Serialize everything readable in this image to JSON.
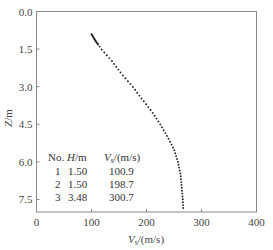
{
  "chart_data": {
    "type": "scatter",
    "title": "",
    "xlabel": "V_s/(m/s)",
    "xlabel_main": "V",
    "xlabel_sub": "s",
    "xlabel_unit": "/(m/s)",
    "ylabel": "Z/m",
    "xlim": [
      0,
      400
    ],
    "ylim": [
      8.0,
      0.0
    ],
    "y_inverted": true,
    "xticks": [
      0,
      100,
      200,
      300,
      400
    ],
    "xtick_labels": [
      "0",
      "100",
      "200",
      "300",
      "400"
    ],
    "yticks": [
      0.0,
      1.5,
      3.0,
      4.5,
      6.0,
      7.5
    ],
    "ytick_labels": [
      "0.0",
      "1.5",
      "3.0",
      "4.5",
      "6.0",
      "7.5"
    ],
    "grid": false,
    "series": [
      {
        "name": "Vs profile",
        "marker": "dot",
        "color": "#222222",
        "profile": [
          {
            "z": 0.9,
            "v": 100
          },
          {
            "z": 1.2,
            "v": 108
          },
          {
            "z": 1.5,
            "v": 118
          },
          {
            "z": 2.0,
            "v": 138
          },
          {
            "z": 2.5,
            "v": 155
          },
          {
            "z": 3.0,
            "v": 175
          },
          {
            "z": 3.5,
            "v": 192
          },
          {
            "z": 4.0,
            "v": 210
          },
          {
            "z": 4.5,
            "v": 225
          },
          {
            "z": 5.0,
            "v": 238
          },
          {
            "z": 5.5,
            "v": 250
          },
          {
            "z": 6.0,
            "v": 257
          },
          {
            "z": 6.5,
            "v": 262
          },
          {
            "z": 7.0,
            "v": 264
          },
          {
            "z": 7.5,
            "v": 266
          },
          {
            "z": 7.95,
            "v": 267
          }
        ]
      }
    ],
    "legend_table": {
      "headers": [
        "No.",
        "H/m",
        "V_s/(m/s)"
      ],
      "header_parts": {
        "no": "No.",
        "h_main": "H",
        "h_unit": "/m",
        "v_main": "V",
        "v_sub": "s",
        "v_unit": "/(m/s)"
      },
      "rows": [
        {
          "no": "1",
          "h": "1.50",
          "v": "100.9"
        },
        {
          "no": "2",
          "h": "1.50",
          "v": "198.7"
        },
        {
          "no": "3",
          "h": "3.48",
          "v": "300.7"
        }
      ],
      "position": "lower-left inside plot"
    }
  }
}
